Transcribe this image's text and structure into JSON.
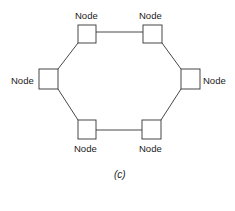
{
  "diagram": {
    "type": "ring-topology",
    "caption": "(c)",
    "nodes": [
      {
        "id": "top-left",
        "label": "Node"
      },
      {
        "id": "top-right",
        "label": "Node"
      },
      {
        "id": "left",
        "label": "Node"
      },
      {
        "id": "right",
        "label": "Node"
      },
      {
        "id": "bottom-left",
        "label": "Node"
      },
      {
        "id": "bottom-right",
        "label": "Node"
      }
    ],
    "edges": [
      [
        "top-left",
        "top-right"
      ],
      [
        "top-right",
        "right"
      ],
      [
        "right",
        "bottom-right"
      ],
      [
        "bottom-right",
        "bottom-left"
      ],
      [
        "bottom-left",
        "left"
      ],
      [
        "left",
        "top-left"
      ]
    ]
  }
}
